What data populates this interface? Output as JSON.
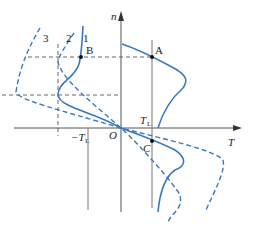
{
  "diagram": {
    "type": "motor mechanical characteristics (n–T) plot",
    "colors": {
      "axis": "#555555",
      "curve": "#3a78c0",
      "guide": "#555555",
      "text": "#222222"
    },
    "axes": {
      "x_label": "T",
      "y_label": "n",
      "origin_label": "O"
    },
    "ticks": {
      "pos_load": {
        "label": "T",
        "sub": "L"
      },
      "neg_load": {
        "label": "−T",
        "sub": "L"
      }
    },
    "points": {
      "A": "A",
      "B": "B",
      "C": "C"
    },
    "curve_labels": {
      "c1": "1",
      "c2": "2",
      "c3": "3"
    }
  }
}
